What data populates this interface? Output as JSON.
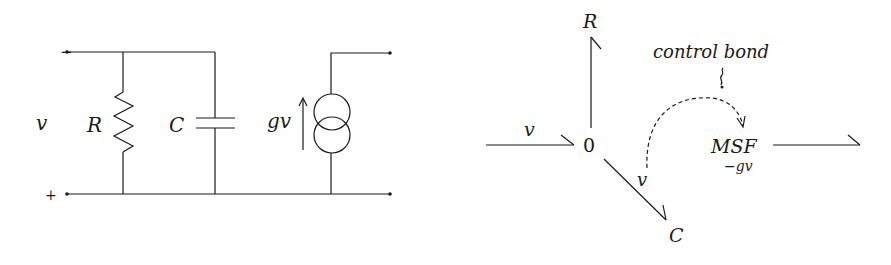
{
  "circuit": {
    "terminal_minus": "−",
    "terminal_plus": "+",
    "voltage_label": "v",
    "resistor_label": "R",
    "capacitor_label": "C",
    "source_label": "gv"
  },
  "bond_graph": {
    "input_effort": "v",
    "junction": "0",
    "resistor_element": "R",
    "capacitor_element": "C",
    "capacitor_effort": "v",
    "source_element": "MSF",
    "source_modulation": "−gv",
    "control_annotation": "control bond"
  },
  "colors": {
    "ink": "#1a1a1a",
    "background": "#ffffff"
  }
}
